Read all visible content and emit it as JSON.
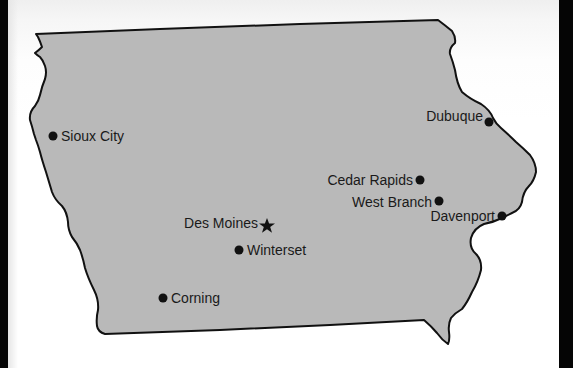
{
  "map": {
    "region": "Iowa",
    "fill_color": "#b9b9b9",
    "outline_color": "#111111",
    "background_color": "#ffffff",
    "frame_color": "#050505",
    "capital_icon": "star-icon",
    "city_icon": "dot-icon"
  },
  "cities": [
    {
      "name": "Sioux City",
      "marker": "dot",
      "x": 53,
      "y": 136,
      "label_side": "right"
    },
    {
      "name": "Dubuque",
      "marker": "dot",
      "x": 489,
      "y": 122,
      "label_side": "left"
    },
    {
      "name": "Cedar Rapids",
      "marker": "dot",
      "x": 420,
      "y": 180,
      "label_side": "left"
    },
    {
      "name": "West Branch",
      "marker": "dot",
      "x": 439,
      "y": 201,
      "label_side": "left"
    },
    {
      "name": "Davenport",
      "marker": "dot",
      "x": 502,
      "y": 216,
      "label_side": "left"
    },
    {
      "name": "Des Moines",
      "marker": "star",
      "x": 267,
      "y": 225,
      "label_side": "left",
      "is_capital": true
    },
    {
      "name": "Winterset",
      "marker": "dot",
      "x": 239,
      "y": 250,
      "label_side": "right"
    },
    {
      "name": "Corning",
      "marker": "dot",
      "x": 163,
      "y": 298,
      "label_side": "right"
    }
  ],
  "labels": {
    "sioux_city": "Sioux City",
    "dubuque": "Dubuque",
    "cedar_rapids": "Cedar Rapids",
    "west_branch": "West Branch",
    "davenport": "Davenport",
    "des_moines": "Des Moines",
    "winterset": "Winterset",
    "corning": "Corning"
  }
}
